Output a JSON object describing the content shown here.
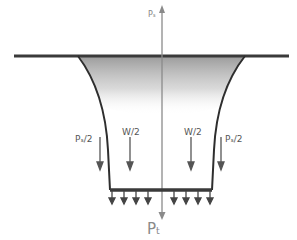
{
  "diagram": {
    "labels": {
      "top_axis": "Pₛ",
      "bottom_axis": "Pₜ",
      "left_side_force": "Pₛ/2",
      "right_side_force": "Pₛ/2",
      "left_weight": "W/2",
      "right_weight": "W/2"
    },
    "colors": {
      "line": "#3a3a3a",
      "axis": "#8a8a8a",
      "arrow": "#555555",
      "shading": "#9a9a9a"
    },
    "base_load_arrow_count": 8
  }
}
